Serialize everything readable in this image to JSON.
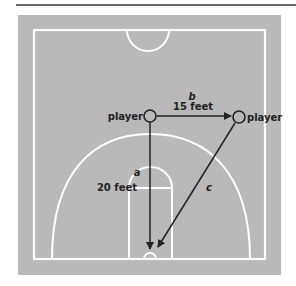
{
  "diagram": {
    "court_color": "#b9b9b9",
    "line_color": "#ffffff",
    "arrow_color": "#222222",
    "players": [
      {
        "label": "player",
        "x": 150,
        "y": 116
      },
      {
        "label": "player",
        "x": 239,
        "y": 117
      }
    ],
    "arrows": [
      {
        "id": "a",
        "letter": "a",
        "distance": "20 feet",
        "from": "left player",
        "to": "basket"
      },
      {
        "id": "b",
        "letter": "b",
        "distance": "15 feet",
        "from": "left player",
        "to": "right player"
      },
      {
        "id": "c",
        "letter": "c",
        "distance": "",
        "from": "right player",
        "to": "basket"
      }
    ]
  }
}
